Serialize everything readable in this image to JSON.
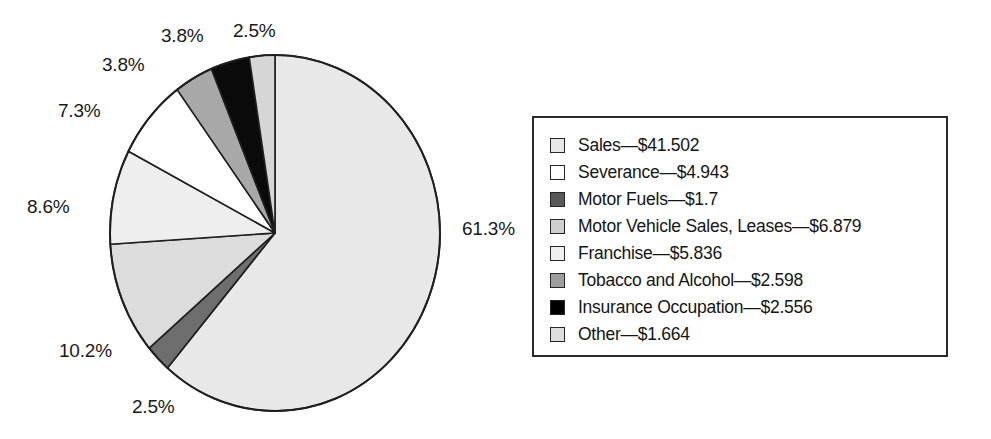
{
  "chart_data": {
    "type": "pie",
    "title": "",
    "subtitle": "",
    "xlabel": "",
    "ylabel": "",
    "grid": false,
    "legend_position": "right",
    "units": "billions of dollars",
    "start_angle_deg": 0,
    "direction": "clockwise",
    "categories": [
      "Sales",
      "Motor Fuels",
      "Motor Vehicle Sales, Leases",
      "Franchise",
      "Severance",
      "Tobacco and Alcohol",
      "Insurance Occupation",
      "Other"
    ],
    "values": [
      41.502,
      1.7,
      6.879,
      5.836,
      4.943,
      2.598,
      2.556,
      1.664
    ],
    "percents": [
      61.3,
      2.5,
      10.2,
      8.6,
      7.3,
      3.8,
      3.8,
      2.5
    ],
    "total": 67.678,
    "slices": [
      {
        "name": "Sales",
        "value": 41.502,
        "value_text": "$41.502",
        "percent": 61.3,
        "percent_text": "61.3%",
        "color": "#e8e8e8"
      },
      {
        "name": "Motor Fuels",
        "value": 1.7,
        "value_text": "$1.7",
        "percent": 2.5,
        "percent_text": "2.5%",
        "color": "#6e6e6e"
      },
      {
        "name": "Motor Vehicle Sales, Leases",
        "value": 6.879,
        "value_text": "$6.879",
        "percent": 10.2,
        "percent_text": "10.2%",
        "color": "#dcdcdc"
      },
      {
        "name": "Franchise",
        "value": 5.836,
        "value_text": "$5.836",
        "percent": 8.6,
        "percent_text": "8.6%",
        "color": "#eeeeee"
      },
      {
        "name": "Severance",
        "value": 4.943,
        "value_text": "$4.943",
        "percent": 7.3,
        "percent_text": "7.3%",
        "color": "#ffffff"
      },
      {
        "name": "Tobacco and Alcohol",
        "value": 2.598,
        "value_text": "$2.598",
        "percent": 3.8,
        "percent_text": "3.8%",
        "color": "#a8a8a8"
      },
      {
        "name": "Insurance Occupation",
        "value": 2.556,
        "value_text": "$2.556",
        "percent": 3.8,
        "percent_text": "3.8%",
        "color": "#0a0a0a"
      },
      {
        "name": "Other",
        "value": 1.664,
        "value_text": "$1.664",
        "percent": 2.5,
        "percent_text": "2.5%",
        "color": "#d6d6d6"
      }
    ]
  },
  "pie": {
    "center_x": 275,
    "center_y": 233,
    "radius_x": 165,
    "radius_y": 178,
    "outline_color": "#1f1f1f"
  },
  "labels": [
    {
      "id": "label-sales",
      "text": "61.3%",
      "x": 462,
      "y": 218
    },
    {
      "id": "label-motor-fuels",
      "text": "2.5%",
      "x": 132,
      "y": 396
    },
    {
      "id": "label-motor-vehicle",
      "text": "10.2%",
      "x": 59,
      "y": 340
    },
    {
      "id": "label-franchise",
      "text": "8.6%",
      "x": 27,
      "y": 196
    },
    {
      "id": "label-severance",
      "text": "7.3%",
      "x": 58,
      "y": 100
    },
    {
      "id": "label-tobacco",
      "text": "3.8%",
      "x": 102,
      "y": 54
    },
    {
      "id": "label-insurance",
      "text": "3.8%",
      "x": 161,
      "y": 25
    },
    {
      "id": "label-other",
      "text": "2.5%",
      "x": 233,
      "y": 20
    }
  ],
  "legend": {
    "items": [
      {
        "label": "Sales—$41.502",
        "color": "#e8e8e8"
      },
      {
        "label": "Severance—$4.943",
        "color": "#ffffff"
      },
      {
        "label": "Motor Fuels—$1.7",
        "color": "#595959"
      },
      {
        "label": "Motor Vehicle Sales, Leases—$6.879",
        "color": "#cfcfcf"
      },
      {
        "label": "Franchise—$5.836",
        "color": "#efefef"
      },
      {
        "label": "Tobacco and Alcohol—$2.598",
        "color": "#9d9d9d"
      },
      {
        "label": "Insurance Occupation—$2.556",
        "color": "#000000"
      },
      {
        "label": "Other—$1.664",
        "color": "#dedede"
      }
    ]
  }
}
